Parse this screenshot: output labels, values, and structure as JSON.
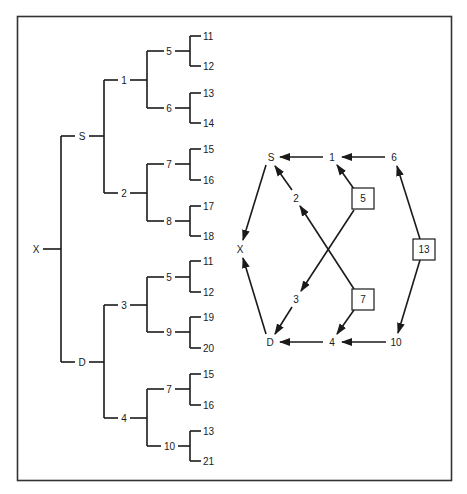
{
  "figure": {
    "tree": {
      "root": "X",
      "level1": [
        "S",
        "D"
      ],
      "level2": [
        "1",
        "2",
        "3",
        "4"
      ],
      "level3": [
        "5",
        "6",
        "7",
        "8",
        "5",
        "9",
        "7",
        "10"
      ],
      "leaves": [
        "11",
        "12",
        "13",
        "14",
        "15",
        "16",
        "17",
        "18",
        "11",
        "12",
        "19",
        "20",
        "15",
        "16",
        "13",
        "21"
      ]
    },
    "graph": {
      "nodes": {
        "S": "S",
        "n1": "1",
        "n6": "6",
        "n2": "2",
        "n5": "5",
        "X": "X",
        "n13": "13",
        "n3": "3",
        "n7": "7",
        "D": "D",
        "n4": "4",
        "n10": "10"
      },
      "boxed_nodes": [
        "5",
        "7",
        "13"
      ],
      "edges": [
        [
          "6",
          "1"
        ],
        [
          "1",
          "S"
        ],
        [
          "5",
          "1"
        ],
        [
          "2",
          "S"
        ],
        [
          "S",
          "X"
        ],
        [
          "13",
          "6"
        ],
        [
          "13",
          "10"
        ],
        [
          "5",
          "3"
        ],
        [
          "7",
          "2"
        ],
        [
          "3",
          "D"
        ],
        [
          "7",
          "4"
        ],
        [
          "10",
          "4"
        ],
        [
          "4",
          "D"
        ],
        [
          "D",
          "X"
        ]
      ]
    }
  }
}
